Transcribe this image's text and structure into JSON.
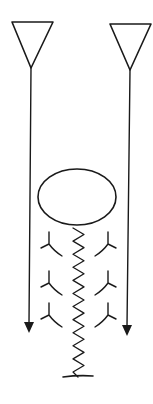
{
  "diagram": {
    "title": "",
    "stroke_color": "#1a1a1a",
    "fill_color": "#1a1a1a",
    "background": "#ffffff",
    "elements": {
      "left_antenna": {
        "shape": "inverted-triangle",
        "connector": "downward-arrow"
      },
      "right_antenna": {
        "shape": "inverted-triangle",
        "connector": "downward-arrow"
      },
      "body": {
        "shape": "ellipse"
      },
      "spring": {
        "shape": "zigzag",
        "terminator": "ground-bar"
      },
      "receptors_left": {
        "shape": "y-curve",
        "count": 3,
        "orientation": "left"
      },
      "receptors_right": {
        "shape": "y-curve",
        "count": 3,
        "orientation": "right"
      }
    }
  }
}
